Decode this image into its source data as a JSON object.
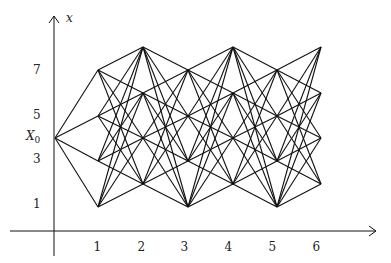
{
  "axes": {
    "vertical_label": "x",
    "origin": [
      54,
      231
    ],
    "x_axis": {
      "from": 10,
      "to": 376
    },
    "y_axis": {
      "from": 256,
      "to": 16
    }
  },
  "y_tick_labels": [
    {
      "text": "7",
      "y": 70
    },
    {
      "text": "5",
      "y": 115
    },
    {
      "text": "3",
      "y": 159
    },
    {
      "text": "1",
      "y": 204
    }
  ],
  "start_label": {
    "text": "X",
    "subscript": "0",
    "y": 138
  },
  "x_tick_labels": [
    {
      "text": "1",
      "x": 97
    },
    {
      "text": "2",
      "x": 141
    },
    {
      "text": "3",
      "x": 184
    },
    {
      "text": "4",
      "x": 228
    },
    {
      "text": "5",
      "x": 272
    },
    {
      "text": "6",
      "x": 316
    }
  ],
  "graph": {
    "start_node": [
      55,
      138
    ],
    "columns": [
      {
        "x": 98,
        "ys": [
          70,
          116,
          161,
          207
        ]
      },
      {
        "x": 143,
        "ys": [
          47,
          93,
          138,
          184
        ]
      },
      {
        "x": 188,
        "ys": [
          70,
          116,
          161,
          207
        ]
      },
      {
        "x": 233,
        "ys": [
          47,
          93,
          138,
          184
        ]
      },
      {
        "x": 277,
        "ys": [
          70,
          116,
          161,
          207
        ]
      },
      {
        "x": 321,
        "ys": [
          47,
          93,
          138,
          184
        ]
      }
    ],
    "edge_color": "#111111",
    "connectivity": "complete-bipartite-between-consecutive-columns"
  }
}
